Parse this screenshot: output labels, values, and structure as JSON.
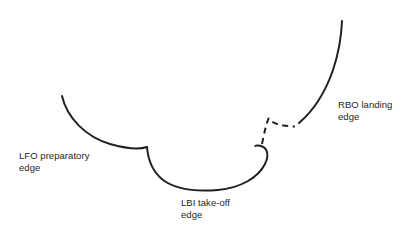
{
  "figure": {
    "background_color": "#ffffff",
    "stroke_color": "#231f20",
    "width": 420,
    "height": 238
  },
  "labels": {
    "lfo": {
      "name": "LFO preparatory edge",
      "line1": "LFO preparatory",
      "line2": "edge",
      "text": "LFO preparatory\nedge"
    },
    "lbi": {
      "name": "LBI take-off edge",
      "line1": "LBI take-off",
      "line2": "edge",
      "text": "LBI take-off\nedge"
    },
    "rbo": {
      "name": "RBO landing edge",
      "line1": "RBO landing",
      "line2": "edge",
      "text": "RBO landing\nedge"
    }
  },
  "chart_data": {
    "type": "line",
    "title": "",
    "xlabel": "",
    "ylabel": "",
    "grid": false,
    "legend": "none",
    "xlim": [
      0,
      420
    ],
    "ylim": [
      238,
      0
    ],
    "annotations": [
      {
        "text": "LFO preparatory edge",
        "x": 19,
        "y": 150
      },
      {
        "text": "LBI take-off edge",
        "x": 181,
        "y": 197
      },
      {
        "text": "RBO landing edge",
        "x": 338,
        "y": 99
      }
    ],
    "series": [
      {
        "name": "LFO preparatory edge",
        "style": "solid",
        "stroke": "#231f20",
        "path": "M62,96 C67,118 86,137 110,144 C126,148.5 140,149.5 147,147",
        "points": [
          [
            62,
            96
          ],
          [
            80,
            123
          ],
          [
            103,
            141
          ],
          [
            125,
            147
          ],
          [
            147,
            147
          ]
        ]
      },
      {
        "name": "LBI take-off edge",
        "style": "solid",
        "stroke": "#231f20",
        "path": "M147,147 C148,160 153,172 163,180 C178,191 200,191.5 218,190 C240,188 258,178 265,164 C270,153.5 267,145.5 257,145.5 C256.2,145.5 255.7,145.7 255.3,146",
        "points": [
          [
            147,
            147
          ],
          [
            160,
            177
          ],
          [
            190,
            190.5
          ],
          [
            218,
            190
          ],
          [
            248,
            181
          ],
          [
            265,
            164
          ],
          [
            257,
            145.5
          ]
        ]
      },
      {
        "name": "connector",
        "style": "dashed",
        "stroke": "#231f20",
        "path": "M262,144 C264,134 266,125 268.5,118.5 C272,124 283,126 295,126.5",
        "points": [
          [
            262,
            144
          ],
          [
            268.5,
            118.5
          ],
          [
            280,
            125
          ],
          [
            295,
            126.5
          ]
        ]
      },
      {
        "name": "RBO landing edge",
        "style": "solid",
        "stroke": "#231f20",
        "path": "M299,123 C312,112 325,93 333,70 C339,52 341.5,34 342,21",
        "points": [
          [
            299,
            123
          ],
          [
            318,
            100
          ],
          [
            333,
            70
          ],
          [
            342,
            21
          ]
        ]
      }
    ]
  }
}
